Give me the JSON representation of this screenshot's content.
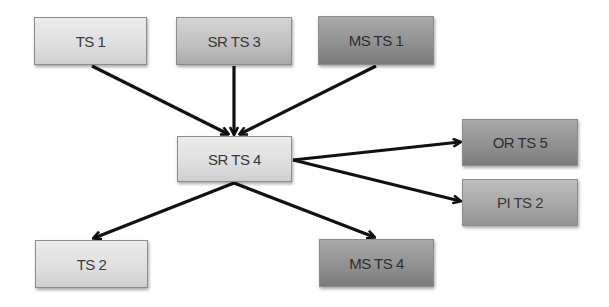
{
  "diagram": {
    "type": "flow",
    "nodes": {
      "ts1": {
        "label": "TS 1"
      },
      "srts3": {
        "label": "SR TS 3"
      },
      "msts1": {
        "label": "MS TS 1"
      },
      "srts4": {
        "label": "SR TS 4"
      },
      "orts5": {
        "label": "OR TS 5"
      },
      "pits2": {
        "label": "PI TS 2"
      },
      "ts2": {
        "label": "TS 2"
      },
      "msts4": {
        "label": "MS TS 4"
      }
    },
    "edges": [
      {
        "from": "TS 1",
        "to": "SR TS 4"
      },
      {
        "from": "SR TS 3",
        "to": "SR TS 4"
      },
      {
        "from": "MS TS 1",
        "to": "SR TS 4"
      },
      {
        "from": "SR TS 4",
        "to": "OR TS 5"
      },
      {
        "from": "SR TS 4",
        "to": "PI TS 2"
      },
      {
        "from": "SR TS 4",
        "to": "TS 2"
      },
      {
        "from": "SR TS 4",
        "to": "MS TS 4"
      }
    ],
    "colors": {
      "light": "#e0e0e0",
      "mid": "#c0c0c0",
      "dark": "#8f8f8f",
      "arrow": "#111111"
    }
  }
}
